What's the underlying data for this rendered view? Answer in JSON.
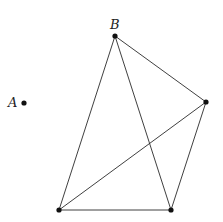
{
  "figure": {
    "width": 223,
    "height": 222,
    "background": "#ffffff",
    "stroke_color": "#2a2a2a",
    "point_color": "#111111",
    "points": [
      {
        "id": "A",
        "label": "A",
        "x": 24,
        "y": 103,
        "label_x": 8,
        "label_y": 107
      },
      {
        "id": "B",
        "label": "B",
        "x": 115,
        "y": 36,
        "label_x": 110,
        "label_y": 29
      },
      {
        "id": "C",
        "label": "",
        "x": 206,
        "y": 102
      },
      {
        "id": "D",
        "label": "",
        "x": 59,
        "y": 210
      },
      {
        "id": "E",
        "label": "",
        "x": 171,
        "y": 210
      }
    ],
    "edges": [
      [
        "B",
        "D"
      ],
      [
        "B",
        "E"
      ],
      [
        "B",
        "C"
      ],
      [
        "C",
        "D"
      ],
      [
        "C",
        "E"
      ],
      [
        "D",
        "E"
      ]
    ]
  },
  "labels": {
    "A": "A",
    "B": "B"
  }
}
